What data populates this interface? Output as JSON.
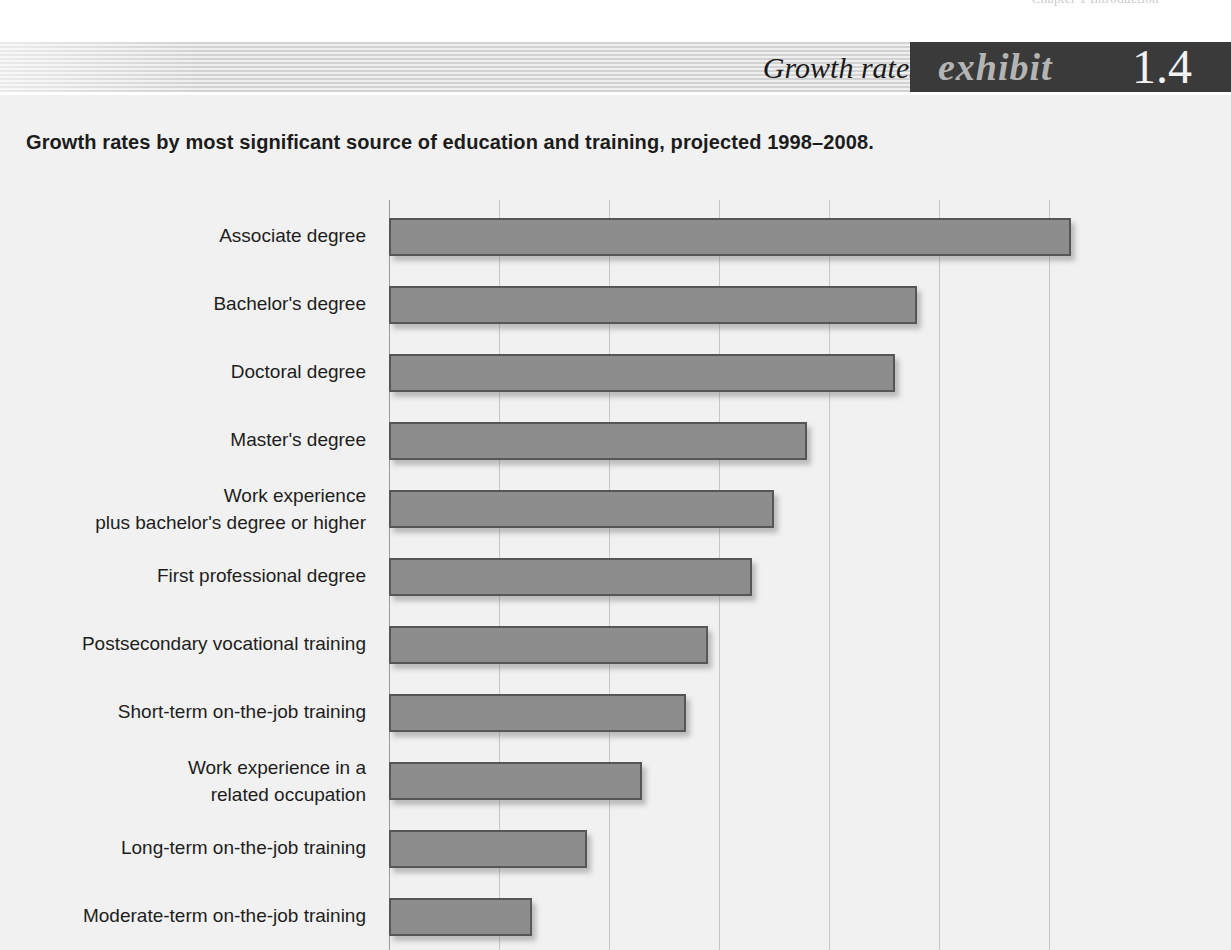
{
  "page": {
    "running_head": "Chapter 1  Introduction"
  },
  "header": {
    "title": "Growth rates by education.",
    "exhibit_word": "exhibit",
    "exhibit_number": "1.4"
  },
  "chart": {
    "subtitle": "Growth rates by most significant source of education and training, projected 1998–2008."
  },
  "colors": {
    "bar_fill": "#8d8d8d",
    "bar_border": "#565656",
    "panel_bg": "#f1f1f1",
    "gridline": "#c6c6c6",
    "tag_bg": "#3a3a3a",
    "tag_word": "#b4b4b4",
    "tag_number": "#f2f2f2"
  },
  "chart_data": {
    "type": "bar",
    "orientation": "horizontal",
    "title": "Growth rates by education.",
    "subtitle": "Growth rates by most significant source of education and training, projected 1998–2008.",
    "xlabel": "",
    "ylabel": "",
    "xlim": [
      0,
      62
    ],
    "grid": true,
    "gridline_values": [
      0,
      10,
      20,
      30,
      40,
      50,
      60
    ],
    "legend": "none",
    "note": "Bar lengths read against vertical gridlines spaced ~10 percentage points apart; values are percent growth projected 1998-2008.",
    "categories": [
      "Associate degree",
      "Bachelor's degree",
      "Doctoral degree",
      "Master's degree",
      "Work experience plus bachelor's degree or higher",
      "First professional degree",
      "Postsecondary vocational training",
      "Short-term on-the-job training",
      "Work experience in a related occupation",
      "Long-term on-the-job training",
      "Moderate-term on-the-job training"
    ],
    "values": [
      62,
      48,
      46,
      38,
      35,
      33,
      29,
      27,
      23,
      18,
      13
    ]
  },
  "rows": [
    {
      "label_lines": [
        "Associate degree"
      ],
      "value": 62
    },
    {
      "label_lines": [
        "Bachelor's degree"
      ],
      "value": 48
    },
    {
      "label_lines": [
        "Doctoral degree"
      ],
      "value": 46
    },
    {
      "label_lines": [
        "Master's degree"
      ],
      "value": 38
    },
    {
      "label_lines": [
        "Work experience",
        "plus bachelor's degree or higher"
      ],
      "value": 35
    },
    {
      "label_lines": [
        "First professional degree"
      ],
      "value": 33
    },
    {
      "label_lines": [
        "Postsecondary vocational training"
      ],
      "value": 29
    },
    {
      "label_lines": [
        "Short-term on-the-job training"
      ],
      "value": 27
    },
    {
      "label_lines": [
        "Work experience in a",
        "related occupation"
      ],
      "value": 23
    },
    {
      "label_lines": [
        "Long-term on-the-job training"
      ],
      "value": 18
    },
    {
      "label_lines": [
        "Moderate-term on-the-job training"
      ],
      "value": 13
    }
  ]
}
